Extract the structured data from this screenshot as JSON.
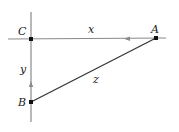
{
  "diagram": {
    "points": {
      "A": {
        "label": "A",
        "x": 156,
        "y": 38
      },
      "B": {
        "label": "B",
        "x": 31,
        "y": 102
      },
      "C": {
        "label": "C",
        "x": 31,
        "y": 39
      }
    },
    "segments": {
      "x": {
        "label": "x",
        "from": "C",
        "to": "A"
      },
      "y": {
        "label": "y",
        "from": "C",
        "to": "B"
      },
      "z": {
        "label": "z",
        "from": "A",
        "to": "B"
      }
    },
    "colors": {
      "axis": "#888888",
      "hypotenuse": "#333333",
      "point": "#111111"
    }
  }
}
